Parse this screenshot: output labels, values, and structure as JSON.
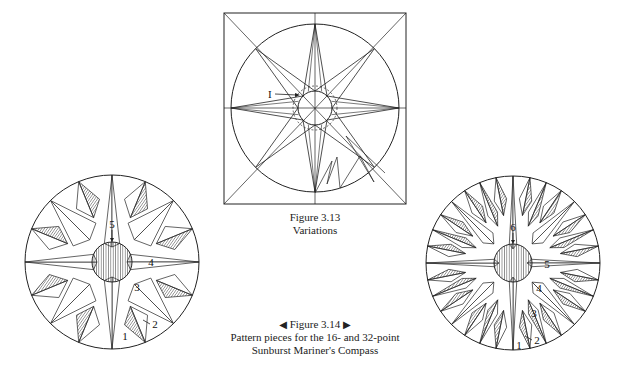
{
  "figure_313": {
    "caption_line1": "Figure 3.13",
    "caption_line2": "Variations",
    "label_I": "I",
    "frame": {
      "x": 224,
      "y": 13,
      "w": 182,
      "h": 191
    },
    "center": [
      315,
      108
    ],
    "outer_radius": 84,
    "inner_radius": 17,
    "dashed_radius": 22
  },
  "figure_314": {
    "prev_arrow": "◀",
    "title": "Figure 3.14",
    "next_arrow": "▶",
    "caption_line2": "Pattern pieces for the 16- and 32-point",
    "caption_line3": "Sunburst Mariner's Compass"
  },
  "compass_16": {
    "center": [
      112,
      262
    ],
    "radius": 87,
    "hub_radius": 20,
    "points": 16,
    "labels": [
      {
        "text": "5",
        "x": 112,
        "y": 228
      },
      {
        "text": "4",
        "x": 151,
        "y": 266
      },
      {
        "text": "3",
        "x": 137,
        "y": 291
      },
      {
        "text": "2",
        "x": 155,
        "y": 328
      },
      {
        "text": "1",
        "x": 125,
        "y": 340
      }
    ]
  },
  "compass_32": {
    "center": [
      513,
      263
    ],
    "radius": 87,
    "hub_radius": 19,
    "points": 32,
    "labels": [
      {
        "text": "6",
        "x": 513,
        "y": 231
      },
      {
        "text": "5",
        "x": 547,
        "y": 268
      },
      {
        "text": "4",
        "x": 539,
        "y": 292
      },
      {
        "text": "3",
        "x": 534,
        "y": 317
      },
      {
        "text": "2",
        "x": 537,
        "y": 344
      },
      {
        "text": "1",
        "x": 519,
        "y": 349
      }
    ]
  },
  "colors": {
    "line": "#222222",
    "hatch": "#555555",
    "paper": "#ffffff"
  }
}
